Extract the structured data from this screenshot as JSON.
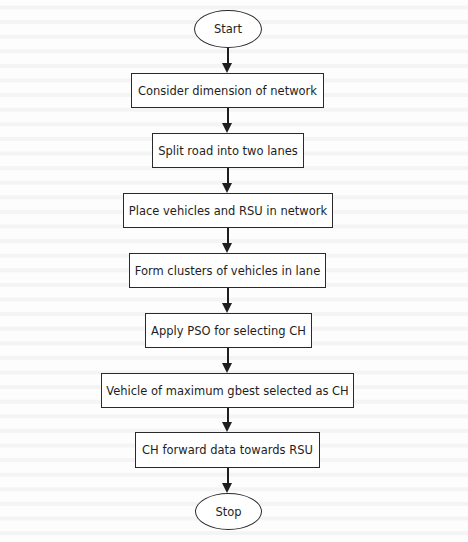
{
  "flowchart": {
    "start": {
      "label": "Start",
      "shape": "ellipse"
    },
    "steps": [
      {
        "label": "Consider dimension of network",
        "shape": "rectangle"
      },
      {
        "label": "Split road into two lanes",
        "shape": "rectangle"
      },
      {
        "label": "Place vehicles and RSU in network",
        "shape": "rectangle"
      },
      {
        "label": "Form clusters of vehicles in lane",
        "shape": "rectangle"
      },
      {
        "label": "Apply PSO for selecting CH",
        "shape": "rectangle"
      },
      {
        "label": "Vehicle of maximum gbest selected as CH",
        "shape": "rectangle"
      },
      {
        "label": "CH forward data towards RSU",
        "shape": "rectangle"
      }
    ],
    "stop": {
      "label": "Stop",
      "shape": "ellipse"
    },
    "edges": [
      [
        "Start",
        "Consider dimension of network"
      ],
      [
        "Consider dimension of network",
        "Split road into two lanes"
      ],
      [
        "Split road into two lanes",
        "Place vehicles and RSU in network"
      ],
      [
        "Place vehicles and RSU in network",
        "Form clusters of vehicles in lane"
      ],
      [
        "Form clusters of vehicles in lane",
        "Apply PSO for selecting CH"
      ],
      [
        "Apply PSO for selecting CH",
        "Vehicle of maximum gbest selected as CH"
      ],
      [
        "Vehicle of maximum gbest selected as CH",
        "CH forward data towards RSU"
      ],
      [
        "CH forward data towards RSU",
        "Stop"
      ]
    ],
    "colors": {
      "stroke": "#2a2a2a",
      "text": "#1e1e1e",
      "fill": "#ffffff",
      "background": "#fdfdfd"
    }
  }
}
